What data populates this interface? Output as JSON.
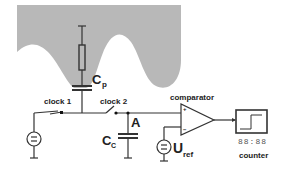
{
  "diagram": {
    "colors": {
      "shape_fill": "#b8b8b8",
      "wire": "#333333",
      "text": "#222222"
    },
    "labels": {
      "cp_main": "C",
      "cp_sub": "p",
      "clock1": "clock 1",
      "clock2": "clock 2",
      "node_a": "A",
      "cc_main": "C",
      "cc_sub": "C",
      "comparator": "comparator",
      "uref_main": "U",
      "uref_sub": "ref",
      "plus": "+",
      "minus": "−",
      "counter_display": "88:88",
      "counter": "counter"
    }
  }
}
